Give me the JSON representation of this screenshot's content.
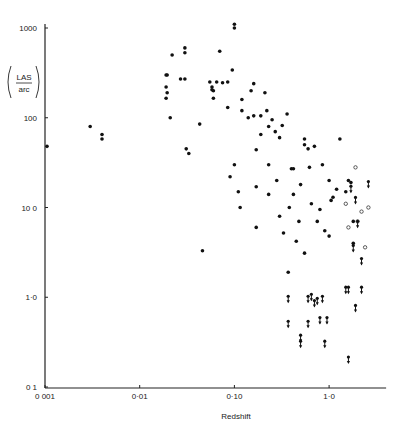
{
  "chart_data": {
    "type": "scatter",
    "title": "",
    "xlabel": "Redshift",
    "ylabel": "LAS / arc",
    "ylabel_parts": {
      "numerator": "LAS",
      "denominator": "arc"
    },
    "xscale": "log",
    "yscale": "log",
    "xlim": [
      0.001,
      4.0
    ],
    "ylim": [
      0.1,
      1000
    ],
    "x_ticks": [
      0.001,
      0.01,
      0.1,
      1.0
    ],
    "x_tick_labels": [
      "0 001",
      "0·01",
      "0·10",
      "1·0"
    ],
    "y_ticks": [
      0.1,
      1.0,
      10.0,
      100,
      1000
    ],
    "y_tick_labels": [
      "0 1",
      "1·0",
      "10 0",
      "100",
      "1000"
    ],
    "grid": false,
    "legend": null,
    "markers": {
      "filled": "detected source (filled dot)",
      "open": "open circle",
      "arrow": "upper limit (arrow down)"
    },
    "series": [
      {
        "name": "filled",
        "points": [
          [
            0.00105,
            48
          ],
          [
            0.003,
            80
          ],
          [
            0.004,
            65
          ],
          [
            0.004,
            58
          ],
          [
            0.019,
            300
          ],
          [
            0.0195,
            300
          ],
          [
            0.019,
            220
          ],
          [
            0.0195,
            190
          ],
          [
            0.019,
            165
          ],
          [
            0.021,
            100
          ],
          [
            0.022,
            500
          ],
          [
            0.027,
            270
          ],
          [
            0.03,
            600
          ],
          [
            0.03,
            530
          ],
          [
            0.03,
            270
          ],
          [
            0.031,
            45
          ],
          [
            0.033,
            40
          ],
          [
            0.043,
            85
          ],
          [
            0.046,
            3.3
          ],
          [
            0.055,
            250
          ],
          [
            0.058,
            220
          ],
          [
            0.058,
            205
          ],
          [
            0.06,
            200
          ],
          [
            0.06,
            165
          ],
          [
            0.065,
            250
          ],
          [
            0.07,
            550
          ],
          [
            0.075,
            245
          ],
          [
            0.085,
            250
          ],
          [
            0.085,
            130
          ],
          [
            0.09,
            22
          ],
          [
            0.095,
            340
          ],
          [
            0.1,
            1100
          ],
          [
            0.1,
            1000
          ],
          [
            0.1,
            30
          ],
          [
            0.11,
            15
          ],
          [
            0.115,
            10
          ],
          [
            0.12,
            120
          ],
          [
            0.12,
            160
          ],
          [
            0.14,
            100
          ],
          [
            0.15,
            200
          ],
          [
            0.16,
            240
          ],
          [
            0.16,
            105
          ],
          [
            0.17,
            44
          ],
          [
            0.17,
            17
          ],
          [
            0.17,
            6
          ],
          [
            0.19,
            65
          ],
          [
            0.19,
            105
          ],
          [
            0.21,
            190
          ],
          [
            0.22,
            120
          ],
          [
            0.23,
            80
          ],
          [
            0.23,
            30
          ],
          [
            0.23,
            14
          ],
          [
            0.25,
            95
          ],
          [
            0.27,
            70
          ],
          [
            0.28,
            20
          ],
          [
            0.3,
            60
          ],
          [
            0.3,
            8
          ],
          [
            0.32,
            82
          ],
          [
            0.33,
            5.2
          ],
          [
            0.36,
            110
          ],
          [
            0.37,
            1.9
          ],
          [
            0.38,
            10
          ],
          [
            0.4,
            27
          ],
          [
            0.42,
            27
          ],
          [
            0.42,
            14
          ],
          [
            0.45,
            4.2
          ],
          [
            0.48,
            7
          ],
          [
            0.5,
            18
          ],
          [
            0.55,
            58
          ],
          [
            0.55,
            50
          ],
          [
            0.55,
            3.1
          ],
          [
            0.6,
            45
          ],
          [
            0.62,
            28
          ],
          [
            0.65,
            11
          ],
          [
            0.7,
            48
          ],
          [
            0.75,
            7
          ],
          [
            0.8,
            9.5
          ],
          [
            0.85,
            30
          ],
          [
            0.9,
            5.5
          ],
          [
            1.0,
            20
          ],
          [
            1.0,
            4.8
          ],
          [
            1.05,
            12
          ],
          [
            1.1,
            13
          ],
          [
            1.2,
            16
          ],
          [
            1.3,
            58
          ],
          [
            1.5,
            15
          ],
          [
            1.6,
            20
          ],
          [
            1.7,
            19
          ],
          [
            1.8,
            7
          ],
          [
            1.8,
            4
          ]
        ]
      },
      {
        "name": "open",
        "points": [
          [
            1.5,
            11
          ],
          [
            1.6,
            6
          ],
          [
            1.9,
            28
          ],
          [
            2.0,
            7
          ],
          [
            2.2,
            9
          ],
          [
            2.4,
            3.6
          ],
          [
            2.6,
            10
          ]
        ]
      },
      {
        "name": "upper_limit",
        "points": [
          [
            0.37,
            0.5
          ],
          [
            0.37,
            0.95
          ],
          [
            0.5,
            0.35
          ],
          [
            0.5,
            0.3
          ],
          [
            0.6,
            0.5
          ],
          [
            0.6,
            0.95
          ],
          [
            0.65,
            1.0
          ],
          [
            0.7,
            0.85
          ],
          [
            0.75,
            0.9
          ],
          [
            0.8,
            0.55
          ],
          [
            0.85,
            0.95
          ],
          [
            0.9,
            0.3
          ],
          [
            0.95,
            0.55
          ],
          [
            1.6,
            0.2
          ],
          [
            1.5,
            1.2
          ],
          [
            1.6,
            1.2
          ],
          [
            1.9,
            0.75
          ],
          [
            2.2,
            1.2
          ],
          [
            2.2,
            2.5
          ],
          [
            2.6,
            18
          ],
          [
            1.7,
            16
          ],
          [
            1.9,
            12
          ],
          [
            1.8,
            3.5
          ],
          [
            2.0,
            6.5
          ]
        ]
      }
    ]
  }
}
